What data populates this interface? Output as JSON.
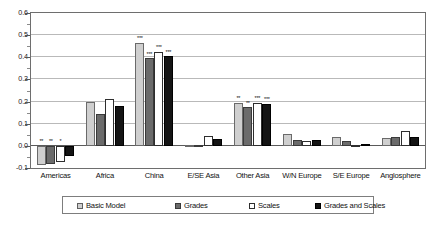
{
  "chart_data": {
    "type": "bar",
    "title": "",
    "xlabel": "",
    "ylabel": "",
    "ylim": [
      -0.1,
      0.6
    ],
    "yticks": [
      "0.6",
      "0.5",
      "0.4",
      "0.3",
      "0.2",
      "0.1",
      "0.0",
      "-0.1"
    ],
    "ytick_values": [
      0.6,
      0.5,
      0.4,
      0.3,
      0.2,
      0.1,
      0.0,
      -0.1
    ],
    "minor_tick_step": 0.05,
    "grid": true,
    "legend_position": "bottom",
    "categories": [
      "Americas",
      "Africa",
      "China",
      "E/SE Asia",
      "Other Asia",
      "W/N Europe",
      "S/E Europe",
      "Anglosphere"
    ],
    "series": [
      {
        "name": "Basic Model",
        "color": "#cfcfcf",
        "values": [
          -0.085,
          0.2,
          0.465,
          0.005,
          0.195,
          0.055,
          0.04,
          0.035
        ],
        "significance": [
          "**",
          "",
          "***",
          "",
          "**",
          "",
          "",
          ""
        ]
      },
      {
        "name": "Grades",
        "color": "#6b6b6b",
        "values": [
          -0.08,
          0.145,
          0.395,
          0.005,
          0.175,
          0.025,
          0.02,
          0.04
        ],
        "significance": [
          "**",
          "",
          "***",
          "",
          "**",
          "",
          "",
          ""
        ]
      },
      {
        "name": "Scales",
        "color": "#ffffff",
        "values": [
          -0.075,
          0.21,
          0.425,
          0.045,
          0.195,
          0.02,
          0.005,
          0.065
        ],
        "significance": [
          "*",
          "",
          "***",
          "",
          "***",
          "",
          "",
          ""
        ]
      },
      {
        "name": "Grades and Scales",
        "color": "#141414",
        "values": [
          -0.048,
          0.18,
          0.405,
          0.03,
          0.19,
          0.025,
          0.01,
          0.04
        ],
        "significance": [
          "",
          "",
          "***",
          "",
          "***",
          "",
          "",
          ""
        ]
      }
    ]
  },
  "legend": {
    "items": [
      {
        "label": "Basic Model"
      },
      {
        "label": "Grades"
      },
      {
        "label": "Scales"
      },
      {
        "label": "Grades and Scales"
      }
    ]
  }
}
